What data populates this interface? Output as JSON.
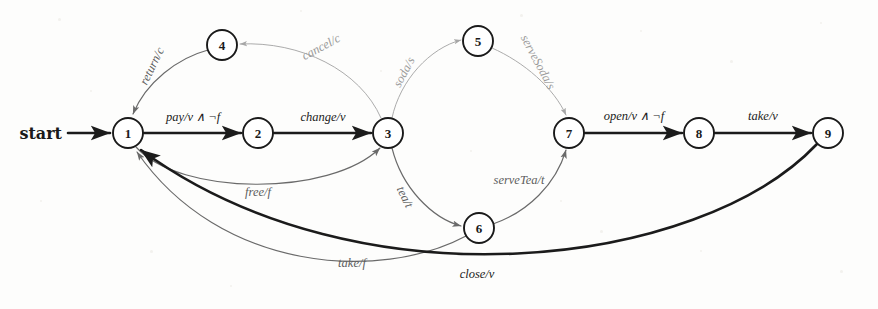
{
  "diagram": {
    "kind": "finite-state-machine",
    "title": "",
    "start_label": "start",
    "canvas": {
      "width": 878,
      "height": 309
    },
    "node_radius": 15,
    "colors": {
      "node_stroke": "#1a1a1a",
      "node_fill": "#ffffff",
      "edge_dark": "#1b1b1b",
      "edge_mid": "#6a6a6a",
      "edge_light": "#a6a6a6",
      "background": "#fdfdfc"
    },
    "nodes": [
      {
        "id": "n1",
        "label": "1",
        "x": 128,
        "y": 133
      },
      {
        "id": "n2",
        "label": "2",
        "x": 258,
        "y": 133
      },
      {
        "id": "n3",
        "label": "3",
        "x": 388,
        "y": 133
      },
      {
        "id": "n4",
        "label": "4",
        "x": 222,
        "y": 45
      },
      {
        "id": "n5",
        "label": "5",
        "x": 478,
        "y": 41
      },
      {
        "id": "n6",
        "label": "6",
        "x": 479,
        "y": 228
      },
      {
        "id": "n7",
        "label": "7",
        "x": 569,
        "y": 133
      },
      {
        "id": "n8",
        "label": "8",
        "x": 699,
        "y": 133
      },
      {
        "id": "n9",
        "label": "9",
        "x": 828,
        "y": 133
      }
    ],
    "edges": [
      {
        "id": "e-start",
        "from": "start",
        "to": "n1",
        "label": "",
        "weight": "dark",
        "path": "M 68,133 L 110,133",
        "label_x": 0,
        "label_y": 0,
        "label_rotate": 0
      },
      {
        "id": "e-pay",
        "from": "n1",
        "to": "n2",
        "label": "pay/v ∧ ¬f",
        "weight": "dark",
        "path": "M 144,133 L 241,133",
        "label_x": 193,
        "label_y": 117,
        "label_rotate": 0
      },
      {
        "id": "e-change",
        "from": "n2",
        "to": "n3",
        "label": "change/v",
        "weight": "dark",
        "path": "M 274,133 L 371,133",
        "label_x": 323,
        "label_y": 117,
        "label_rotate": 0
      },
      {
        "id": "e-return",
        "from": "n4",
        "to": "n1",
        "label": "return/c",
        "weight": "mid",
        "path": "M 208,50 C 178,58 146,82 133,114",
        "label_x": 152,
        "label_y": 66,
        "label_rotate": -64
      },
      {
        "id": "e-cancel",
        "from": "n3",
        "to": "n4",
        "label": "cancel/c",
        "weight": "light",
        "path": "M 381,118 C 360,70 300,41 240,44",
        "label_x": 321,
        "label_y": 47,
        "label_rotate": -28
      },
      {
        "id": "e-free",
        "from": "n1",
        "to": "n3",
        "label": "free/f",
        "weight": "mid",
        "path": "M 136,147 C 180,196 330,197 380,148",
        "label_x": 258,
        "label_y": 192,
        "label_rotate": 0
      },
      {
        "id": "e-soda",
        "from": "n3",
        "to": "n5",
        "label": "soda/s",
        "weight": "light",
        "path": "M 392,118 C 400,80 430,48 461,40",
        "label_x": 404,
        "label_y": 72,
        "label_rotate": -62
      },
      {
        "id": "e-servesoda",
        "from": "n5",
        "to": "n7",
        "label": "serveSoda/s",
        "weight": "light",
        "path": "M 492,48 C 524,62 554,88 566,115",
        "label_x": 538,
        "label_y": 62,
        "label_rotate": 62
      },
      {
        "id": "e-tea",
        "from": "n3",
        "to": "n6",
        "label": "tea/t",
        "weight": "mid",
        "path": "M 392,148 C 402,188 432,218 461,226",
        "label_x": 405,
        "label_y": 197,
        "label_rotate": 64
      },
      {
        "id": "e-servetea",
        "from": "n6",
        "to": "n7",
        "label": "serveTea/t",
        "weight": "mid",
        "path": "M 493,224 C 528,212 556,184 566,150",
        "label_x": 519,
        "label_y": 180,
        "label_rotate": 0
      },
      {
        "id": "e-open",
        "from": "n7",
        "to": "n8",
        "label": "open/v ∧ ¬f",
        "weight": "dark",
        "path": "M 585,133 L 682,133",
        "label_x": 634,
        "label_y": 116,
        "label_rotate": 0
      },
      {
        "id": "e-take-v",
        "from": "n8",
        "to": "n9",
        "label": "take/v",
        "weight": "dark",
        "path": "M 715,133 L 811,133",
        "label_x": 763,
        "label_y": 116,
        "label_rotate": 0
      },
      {
        "id": "e-take-f",
        "from": "n6",
        "to": "n1",
        "label": "take/f",
        "weight": "mid",
        "path": "M 466,236 C 380,282 220,272 137,152",
        "label_x": 352,
        "label_y": 263,
        "label_rotate": 0
      },
      {
        "id": "e-close",
        "from": "n9",
        "to": "n1",
        "label": "close/v",
        "weight": "dark",
        "path": "M 817,144 C 700,268 360,310 141,150",
        "label_x": 477,
        "label_y": 274,
        "label_rotate": 0
      }
    ]
  }
}
